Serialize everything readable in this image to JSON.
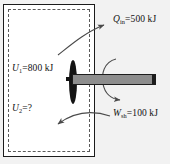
{
  "figure": {
    "background_color": "#f2f2f2",
    "tank_fill_color": "#ffffff",
    "wall_color": "#1b1b1b",
    "boundary_color": "#5a5a5a",
    "shaft_color": "#8d8d8d",
    "paddle_color": "#141414",
    "arrow_color": "#4a4a4a"
  },
  "labels": {
    "u1": {
      "symbol": "U",
      "subscript": "1",
      "relation": "=",
      "value": "800 kJ"
    },
    "u2": {
      "symbol": "U",
      "subscript": "2",
      "relation": "=",
      "value": "?"
    },
    "q_in": {
      "symbol": "Q",
      "subscript": "in",
      "relation": "=",
      "value": "500 kJ"
    },
    "w_sh": {
      "symbol": "W",
      "subscript": "sh",
      "relation": "=",
      "value": "100 kJ"
    }
  },
  "elements": {
    "tank_wall": "rigid-tank-wall",
    "system_boundary": "dashed-system-boundary",
    "paddle_wheel": "paddle-wheel",
    "shaft": "horizontal-shaft",
    "heat_arrow": "heat-input-arrow",
    "work_arrow": "shaft-work-arrow",
    "rotation_arrow": "shaft-rotation-arrow"
  }
}
